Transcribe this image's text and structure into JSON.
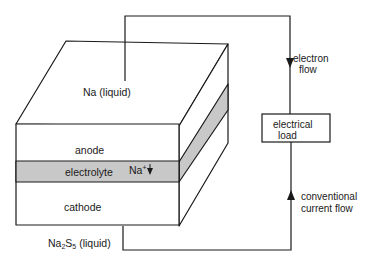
{
  "diagram": {
    "labels": {
      "anode_material": "Na (liquid)",
      "anode": "anode",
      "electrolyte": "electrolyte",
      "ion": "Na",
      "ion_charge": "+",
      "cathode": "cathode",
      "cathode_material_prefix": "Na",
      "cathode_material_sub1": "2",
      "cathode_material_mid": "S",
      "cathode_material_sub2": "5",
      "cathode_material_suffix": " (liquid)",
      "load_line1": "electrical",
      "load_line2": "load",
      "electron_flow_line1": "electron",
      "electron_flow_line2": "flow",
      "current_flow_line1": "conventional",
      "current_flow_line2": "current flow"
    },
    "colors": {
      "line": "#1a1a1a",
      "electrolyte_fill": "#c8c8c8",
      "background": "#ffffff"
    }
  }
}
